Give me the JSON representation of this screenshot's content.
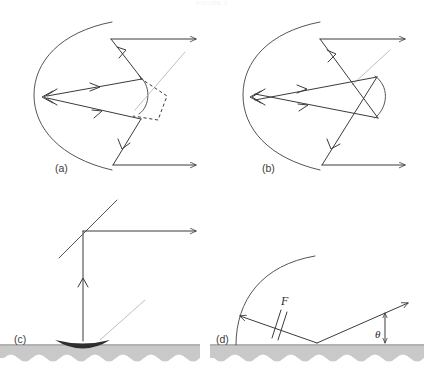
{
  "figure": {
    "header_caption": "FIGURE 1",
    "type": "optics-ray-diagram",
    "background_color": "#ffffff",
    "ink_color": "#3b3b3b",
    "mirror_color": "#555555",
    "faint_color": "#b8b8b8",
    "ground_color": "#c9c9c9",
    "dish_color": "#2e2e2e"
  },
  "panels": [
    {
      "id": "panel-a",
      "label": "(a)",
      "label_x": 55,
      "label_y": 172,
      "description": "Cassegrain-type reflector: large concave primary arc on the left, small convex secondary on the right, horizontal incoming rays reflect off the primary, strike the convex secondary and converge back to the primary vertex.",
      "secondary_mirror": "convex",
      "has_dashed_construction": true
    },
    {
      "id": "panel-b",
      "label": "(b)",
      "label_x": 262,
      "label_y": 172,
      "description": "Gregorian-type reflector: large concave primary arc on the left, concave secondary on the right, rays cross over between the secondary and the converging point at the primary vertex.",
      "secondary_mirror": "concave",
      "has_dashed_construction": false
    },
    {
      "id": "panel-c",
      "label": "(c)",
      "label_x": 14,
      "label_y": 343,
      "description": "Ground-based dish antenna on hatched earth, vertical ray upward to a tilted flat mirror, then reflected horizontally to the right.",
      "has_ground": true,
      "has_dish": true
    },
    {
      "id": "panel-d",
      "label": "(d)",
      "label_x": 216,
      "label_y": 343,
      "description": "Grazing incidence arc mirror at left on hatched earth; ray reflects from the ground up to the right at an angle theta measured from the vertical reference arrow.",
      "has_ground": true,
      "labels": [
        {
          "name": "focal-length-label",
          "text": "F",
          "x": 281,
          "y": 305
        },
        {
          "name": "angle-theta-label",
          "text": "θ",
          "x": 381,
          "y": 338
        }
      ]
    }
  ],
  "annotations": {
    "focal_length_symbol": "F",
    "angle_symbol": "θ",
    "tick_marks_count": 2
  }
}
